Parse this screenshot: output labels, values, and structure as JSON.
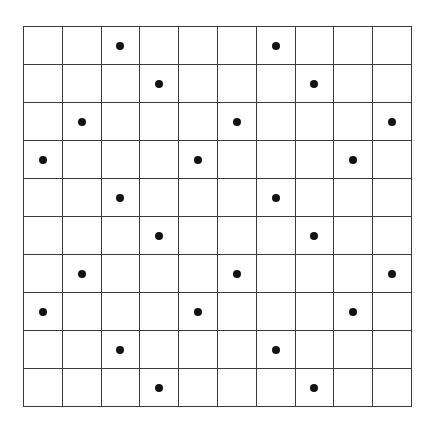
{
  "figure": {
    "name": "dot-grid-pattern",
    "grid": {
      "rows": 10,
      "columns": 10,
      "line_color": "#3a3a3a",
      "cell_background": "#ffffff",
      "left": 23,
      "top": 26,
      "width": 389,
      "height": 381
    },
    "dot": {
      "color": "#111111",
      "diameter_px": 8,
      "shape": "circle",
      "count": 24
    },
    "dot_cells": [
      [
        1,
        3
      ],
      [
        1,
        7
      ],
      [
        2,
        4
      ],
      [
        2,
        8
      ],
      [
        3,
        2
      ],
      [
        3,
        6
      ],
      [
        3,
        10
      ],
      [
        4,
        1
      ],
      [
        4,
        5
      ],
      [
        4,
        9
      ],
      [
        5,
        3
      ],
      [
        5,
        7
      ],
      [
        6,
        4
      ],
      [
        6,
        8
      ],
      [
        7,
        2
      ],
      [
        7,
        6
      ],
      [
        7,
        10
      ],
      [
        8,
        1
      ],
      [
        8,
        5
      ],
      [
        8,
        9
      ],
      [
        9,
        3
      ],
      [
        9,
        7
      ],
      [
        10,
        4
      ],
      [
        10,
        8
      ]
    ],
    "rows_detail": [
      {
        "row": 1,
        "dot_columns": [
          3,
          7
        ]
      },
      {
        "row": 2,
        "dot_columns": [
          4,
          8
        ]
      },
      {
        "row": 3,
        "dot_columns": [
          2,
          6,
          10
        ]
      },
      {
        "row": 4,
        "dot_columns": [
          1,
          5,
          9
        ]
      },
      {
        "row": 5,
        "dot_columns": [
          3,
          7
        ]
      },
      {
        "row": 6,
        "dot_columns": [
          4,
          8
        ]
      },
      {
        "row": 7,
        "dot_columns": [
          2,
          6,
          10
        ]
      },
      {
        "row": 8,
        "dot_columns": [
          1,
          5,
          9
        ]
      },
      {
        "row": 9,
        "dot_columns": [
          3,
          7
        ]
      },
      {
        "row": 10,
        "dot_columns": [
          4,
          8
        ]
      }
    ]
  },
  "chart_data": {
    "type": "scatter",
    "title": "",
    "xlabel": "",
    "ylabel": "",
    "xlim": [
      1,
      10
    ],
    "ylim": [
      1,
      10
    ],
    "grid": true,
    "legend": null,
    "categories": [
      "1",
      "2",
      "3",
      "4",
      "5",
      "6",
      "7",
      "8",
      "9",
      "10"
    ],
    "series": [
      {
        "name": "dots",
        "marker": "filled-circle",
        "color": "#111111",
        "points": [
          {
            "col": 3,
            "row": 1
          },
          {
            "col": 7,
            "row": 1
          },
          {
            "col": 4,
            "row": 2
          },
          {
            "col": 8,
            "row": 2
          },
          {
            "col": 2,
            "row": 3
          },
          {
            "col": 6,
            "row": 3
          },
          {
            "col": 10,
            "row": 3
          },
          {
            "col": 1,
            "row": 4
          },
          {
            "col": 5,
            "row": 4
          },
          {
            "col": 9,
            "row": 4
          },
          {
            "col": 3,
            "row": 5
          },
          {
            "col": 7,
            "row": 5
          },
          {
            "col": 4,
            "row": 6
          },
          {
            "col": 8,
            "row": 6
          },
          {
            "col": 2,
            "row": 7
          },
          {
            "col": 6,
            "row": 7
          },
          {
            "col": 10,
            "row": 7
          },
          {
            "col": 1,
            "row": 8
          },
          {
            "col": 5,
            "row": 8
          },
          {
            "col": 9,
            "row": 8
          },
          {
            "col": 3,
            "row": 9
          },
          {
            "col": 7,
            "row": 9
          },
          {
            "col": 4,
            "row": 10
          },
          {
            "col": 8,
            "row": 10
          }
        ]
      }
    ]
  }
}
